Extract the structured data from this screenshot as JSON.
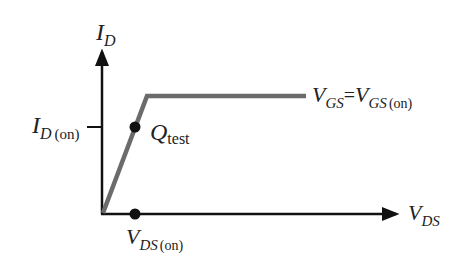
{
  "diagram": {
    "y_axis": {
      "var": "I",
      "sub": "D"
    },
    "x_axis": {
      "var": "V",
      "sub": "DS"
    },
    "tick_label": {
      "var": "I",
      "sub": "D",
      "suffix": "(on)"
    },
    "point_label": {
      "var": "Q",
      "sub": "test"
    },
    "vds_on_label": {
      "var": "V",
      "sub": "DS",
      "suffix": "(on)"
    },
    "curve_label": {
      "lhs_var": "V",
      "lhs_sub": "GS",
      "eq": "=",
      "rhs_var": "V",
      "rhs_sub": "GS",
      "rhs_suffix": "(on)"
    },
    "colors": {
      "axis": "#111111",
      "curve": "#6b6b6b",
      "dot": "#111111",
      "text": "#222222"
    }
  }
}
